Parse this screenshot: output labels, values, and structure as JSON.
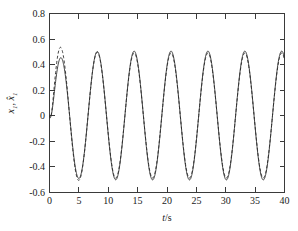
{
  "chart_data": {
    "type": "line",
    "title": "",
    "xlabel": "t/s",
    "ylabel": "x1, x1_hat",
    "ylabel_parts": {
      "first": "x",
      "first_sub": "1",
      "separator": ", ",
      "second": "x",
      "second_sub": "1",
      "second_accent": "hat"
    },
    "xlim": [
      0,
      40
    ],
    "ylim": [
      -0.6,
      0.8
    ],
    "xticks": [
      0,
      5,
      10,
      15,
      20,
      25,
      30,
      35,
      40
    ],
    "xtick_labels": [
      "0",
      "5",
      "10",
      "15",
      "20",
      "25",
      "30",
      "35",
      "40"
    ],
    "yticks": [
      -0.6,
      -0.4,
      -0.2,
      0,
      0.2,
      0.4,
      0.6,
      0.8
    ],
    "ytick_labels": [
      "-0.6",
      "-0.4",
      "-0.2",
      "0",
      "0.2",
      "0.4",
      "0.6",
      "0.8"
    ],
    "grid": false,
    "legend_position": "none",
    "frame": "box",
    "tick_direction": "in",
    "series": [
      {
        "name": "x1",
        "style": "solid",
        "color": "#2b2b2b",
        "description": "actual state, sinusoidal steady oscillation",
        "amplitude_steady": 0.505,
        "peak_value": 0.5,
        "trough_value": -0.51,
        "period": 6.28,
        "first_peak_t": 1.85,
        "first_peak_value": 0.43,
        "start_value": 0.0
      },
      {
        "name": "x1_hat",
        "style": "dashed",
        "color": "#2b2b2b",
        "description": "estimated state, overshoots on first peak then converges",
        "amplitude_steady": 0.49,
        "peak_value": 0.49,
        "trough_value": -0.48,
        "period": 6.28,
        "first_peak_t": 1.85,
        "first_peak_value": 0.62,
        "start_value": 0.0
      }
    ],
    "peaks_t": [
      1.85,
      8.05,
      14.3,
      20.6,
      26.85,
      33.1,
      39.4
    ],
    "troughs_t": [
      4.9,
      11.2,
      17.5,
      23.7,
      30.0,
      36.3
    ]
  }
}
